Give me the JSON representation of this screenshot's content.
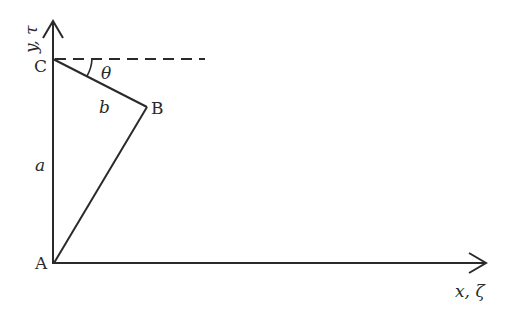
{
  "diagram": {
    "type": "geometry",
    "axes": {
      "vertical_label": "y, τ",
      "horizontal_label": "x, ζ"
    },
    "points": {
      "A": "A",
      "B": "B",
      "C": "C"
    },
    "segments": {
      "AC_label": "a",
      "CB_label": "b"
    },
    "angle_label": "θ",
    "colors": {
      "stroke": "#2a2a2a",
      "background": "#ffffff"
    }
  }
}
